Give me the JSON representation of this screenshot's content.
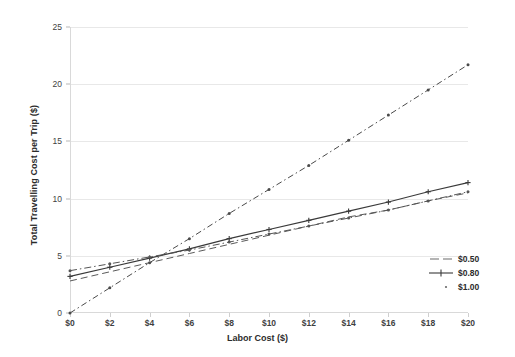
{
  "chart_data": {
    "type": "line",
    "title": "",
    "xlabel": "Labor Cost ($)",
    "ylabel": "Total Travelling Cost per Trip ($)",
    "xlim": [
      0,
      20
    ],
    "ylim": [
      0,
      25
    ],
    "x": [
      0,
      2,
      4,
      6,
      8,
      10,
      12,
      14,
      16,
      18,
      20
    ],
    "xticklabels": [
      "$0",
      "$2",
      "$4",
      "$6",
      "$8",
      "$10",
      "$12",
      "$14",
      "$16",
      "$18",
      "$20"
    ],
    "yticks": [
      0,
      5,
      10,
      15,
      20,
      25
    ],
    "yticklabels": [
      "0",
      "5",
      "10",
      "15",
      "20",
      "25"
    ],
    "grid": "horizontal",
    "legend_position": "right-center",
    "series": [
      {
        "name": "$0.50",
        "style": "dashed",
        "marker": "none",
        "color": "#5a5a5a",
        "values": [
          2.8,
          3.6,
          4.4,
          5.2,
          6.0,
          6.8,
          7.6,
          8.4,
          9.0,
          9.8,
          10.5
        ]
      },
      {
        "name": "$0.80",
        "style": "solid",
        "marker": "plus",
        "color": "#3a3a3a",
        "values": [
          3.2,
          4.0,
          4.8,
          5.6,
          6.5,
          7.3,
          8.1,
          8.9,
          9.7,
          10.6,
          11.4
        ]
      },
      {
        "name": "$1.00",
        "style": "dash-dot",
        "marker": "dot",
        "color": "#555555",
        "values": [
          3.7,
          4.3,
          4.9,
          5.5,
          6.2,
          6.9,
          7.6,
          8.3,
          9.0,
          9.8,
          10.6
        ]
      },
      {
        "name": "steep",
        "style": "dash-dot-steep",
        "marker": "dot",
        "color": "#4a4a4a",
        "values": [
          0.0,
          2.2,
          4.4,
          6.5,
          8.7,
          10.8,
          12.9,
          15.1,
          17.3,
          19.5,
          21.7
        ]
      }
    ],
    "legend": [
      {
        "label": "$0.50",
        "style": "dashed"
      },
      {
        "label": "$0.80",
        "style": "solid-marker"
      },
      {
        "label": "$1.00",
        "style": "dotted"
      }
    ]
  }
}
